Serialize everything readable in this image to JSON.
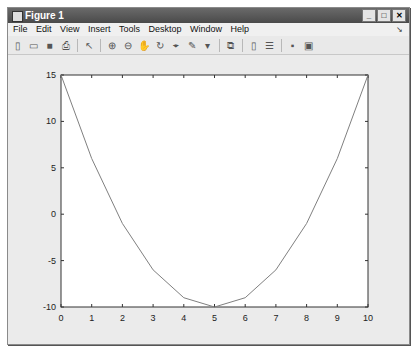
{
  "window": {
    "title": "Figure 1",
    "buttons": {
      "minimize": "_",
      "maximize": "□",
      "close": "✕"
    }
  },
  "menu": {
    "items": [
      "File",
      "Edit",
      "View",
      "Insert",
      "Tools",
      "Desktop",
      "Window",
      "Help"
    ],
    "dock_arrow": "↘"
  },
  "toolbar": {
    "icons": [
      {
        "name": "new-figure-icon",
        "glyph": "▯"
      },
      {
        "name": "open-file-icon",
        "glyph": "▭"
      },
      {
        "name": "save-icon",
        "glyph": "■"
      },
      {
        "name": "print-icon",
        "glyph": "⎙"
      },
      {
        "sep": true
      },
      {
        "name": "edit-plot-icon",
        "glyph": "↖"
      },
      {
        "sep": true
      },
      {
        "name": "zoom-in-icon",
        "glyph": "⊕"
      },
      {
        "name": "zoom-out-icon",
        "glyph": "⊖"
      },
      {
        "name": "pan-icon",
        "glyph": "✋"
      },
      {
        "name": "rotate-3d-icon",
        "glyph": "↻"
      },
      {
        "name": "data-cursor-icon",
        "glyph": "⌖"
      },
      {
        "name": "brush-icon",
        "glyph": "✎"
      },
      {
        "name": "brush-dropdown-icon",
        "glyph": "▾"
      },
      {
        "sep": true
      },
      {
        "name": "link-plot-icon",
        "glyph": "⧉"
      },
      {
        "sep": true
      },
      {
        "name": "insert-colorbar-icon",
        "glyph": "▯"
      },
      {
        "name": "insert-legend-icon",
        "glyph": "☰"
      },
      {
        "sep": true
      },
      {
        "name": "hide-plot-tools-icon",
        "glyph": "▪"
      },
      {
        "name": "show-plot-tools-icon",
        "glyph": "▣"
      }
    ]
  },
  "chart_data": {
    "type": "line",
    "title": "",
    "xlabel": "",
    "ylabel": "",
    "x": [
      0,
      1,
      2,
      3,
      4,
      5,
      6,
      7,
      8,
      9,
      10
    ],
    "series": [
      {
        "name": "y",
        "values": [
          15,
          6,
          -1,
          -6,
          -9,
          -10,
          -9,
          -6,
          -1,
          6,
          15
        ],
        "color": "#808080"
      }
    ],
    "xlim": [
      0,
      10
    ],
    "ylim": [
      -10,
      15
    ],
    "xticks": [
      0,
      1,
      2,
      3,
      4,
      5,
      6,
      7,
      8,
      9,
      10
    ],
    "yticks": [
      15,
      10,
      5,
      0,
      -5,
      -10
    ],
    "grid": false,
    "legend": null
  }
}
